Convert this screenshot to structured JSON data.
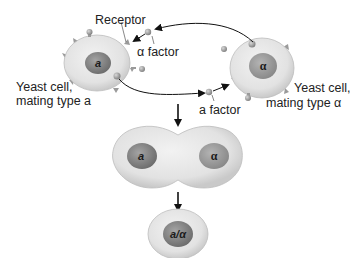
{
  "labels": {
    "receptor": "Receptor",
    "alpha_factor": "α factor",
    "a_factor": "a factor",
    "cell_a_line1": "Yeast cell,",
    "cell_a_line2": "mating type a",
    "cell_alpha_line1": "Yeast cell,",
    "cell_alpha_line2": "mating type α"
  },
  "nuclei": {
    "cell_a": "a",
    "cell_alpha": "α",
    "fused_left": "a",
    "fused_right": "α",
    "diploid": "a/α"
  },
  "colors": {
    "cytoplasm": "#e4e4e4",
    "cytoplasm_edge": "#c8c8c8",
    "nucleus": "#8e8e8e",
    "nucleus_dark": "#6e6e6e",
    "receptor": "#9a9a9a",
    "pheromone": "#a8a8a8",
    "arrow": "#111111",
    "text": "#222222"
  }
}
